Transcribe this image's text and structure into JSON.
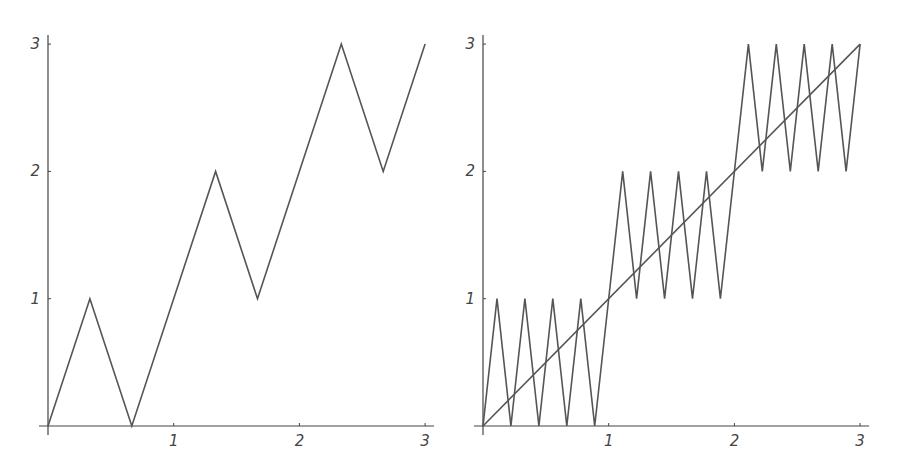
{
  "chart_data": [
    {
      "type": "line",
      "title": "",
      "xlabel": "",
      "ylabel": "",
      "xlim": [
        0,
        3
      ],
      "ylim": [
        0,
        3
      ],
      "grid": false,
      "x_ticks": [
        "1",
        "2",
        "3"
      ],
      "y_ticks": [
        "1",
        "2",
        "3"
      ],
      "series": [
        {
          "name": "zigzag",
          "points": [
            [
              0,
              0
            ],
            [
              0.3333,
              1
            ],
            [
              0.6667,
              0
            ],
            [
              1.3333,
              2
            ],
            [
              1.6667,
              1
            ],
            [
              2.3333,
              3
            ],
            [
              2.6667,
              2
            ],
            [
              3,
              3
            ]
          ]
        }
      ]
    },
    {
      "type": "line",
      "title": "",
      "xlabel": "",
      "ylabel": "",
      "xlim": [
        0,
        3
      ],
      "ylim": [
        0,
        3
      ],
      "grid": false,
      "x_ticks": [
        "1",
        "2",
        "3"
      ],
      "y_ticks": [
        "1",
        "2",
        "3"
      ],
      "series": [
        {
          "name": "fine-zigzag",
          "points": [
            [
              0,
              0
            ],
            [
              0.1111,
              1
            ],
            [
              0.2222,
              0
            ],
            [
              0.3333,
              1
            ],
            [
              0.4444,
              0
            ],
            [
              0.5556,
              1
            ],
            [
              0.6667,
              0
            ],
            [
              0.7778,
              1
            ],
            [
              0.8889,
              0
            ],
            [
              1.1111,
              2
            ],
            [
              1.2222,
              1
            ],
            [
              1.3333,
              2
            ],
            [
              1.4444,
              1
            ],
            [
              1.5556,
              2
            ],
            [
              1.6667,
              1
            ],
            [
              1.7778,
              2
            ],
            [
              1.8889,
              1
            ],
            [
              2.1111,
              3
            ],
            [
              2.2222,
              2
            ],
            [
              2.3333,
              3
            ],
            [
              2.4444,
              2
            ],
            [
              2.5556,
              3
            ],
            [
              2.6667,
              2
            ],
            [
              2.7778,
              3
            ],
            [
              2.8889,
              2
            ],
            [
              3,
              3
            ]
          ]
        },
        {
          "name": "diagonal",
          "points": [
            [
              0,
              0
            ],
            [
              3,
              3
            ]
          ]
        }
      ]
    }
  ],
  "colors": {
    "line": "#555555",
    "axis": "#444444"
  }
}
